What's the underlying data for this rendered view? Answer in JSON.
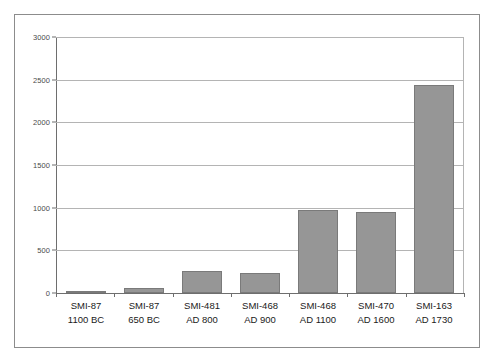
{
  "chart_data": {
    "type": "bar",
    "title": "",
    "subtitle": "",
    "xlabel": "",
    "ylabel": "",
    "ylim": [
      0,
      3000
    ],
    "grid": true,
    "legend": false,
    "legend_position": "none",
    "bar_color": "#969696",
    "bar_border_color": "#7a7a7a",
    "gridline_color": "#b4b4b4",
    "axis_color": "#6e6e6e",
    "frame_color": "#8c8c8c",
    "ytick_labels": [
      "3000",
      "2500",
      "2000",
      "1500",
      "1000",
      "500",
      "0"
    ],
    "ytick_values": [
      3000,
      2500,
      2000,
      1500,
      1000,
      500,
      0
    ],
    "categories": [
      "SMI-87 1100 BC",
      "SMI-87 650 BC",
      "SMI-481 AD 800",
      "SMI-468 AD 900",
      "SMI-468 AD 1100",
      "SMI-470 AD 1600",
      "SMI-163 AD 1730"
    ],
    "category_lines": [
      {
        "line1": "SMI-87",
        "line2": "1100 BC"
      },
      {
        "line1": "SMI-87",
        "line2": "650 BC"
      },
      {
        "line1": "SMI-481",
        "line2": "AD 800"
      },
      {
        "line1": "SMI-468",
        "line2": "AD 900"
      },
      {
        "line1": "SMI-468",
        "line2": "AD 1100"
      },
      {
        "line1": "SMI-470",
        "line2": "AD 1600"
      },
      {
        "line1": "SMI-163",
        "line2": "AD 1730"
      }
    ],
    "values": [
      25,
      55,
      260,
      235,
      970,
      950,
      2437
    ]
  }
}
